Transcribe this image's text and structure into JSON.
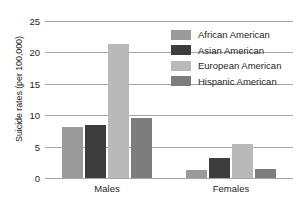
{
  "chart_data": {
    "type": "bar",
    "title": "",
    "xlabel": "",
    "ylabel": "Suicide rates (per 100,000)",
    "categories": [
      "Males",
      "Females"
    ],
    "series": [
      {
        "name": "African American",
        "color": "#9a9a9a",
        "values": [
          8.2,
          1.3
        ]
      },
      {
        "name": "Asian American",
        "color": "#3d3d3d",
        "values": [
          8.4,
          3.2
        ]
      },
      {
        "name": "European American",
        "color": "#b9b9b9",
        "values": [
          21.3,
          5.4
        ]
      },
      {
        "name": "Hispanic American",
        "color": "#7d7d7d",
        "values": [
          9.6,
          1.5
        ]
      }
    ],
    "ylim": [
      0,
      25
    ],
    "yticks": [
      0,
      5,
      10,
      15,
      20,
      25
    ],
    "ytick_labels": [
      "0",
      "5",
      "10",
      "15",
      "20",
      "25"
    ],
    "grid": true,
    "legend_position": "upper right",
    "gridline_color": "#a6a6a6",
    "text_color": "#231f20"
  }
}
